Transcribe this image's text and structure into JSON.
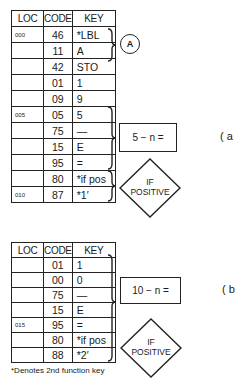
{
  "headers": [
    "LOC",
    "CODE",
    "KEY"
  ],
  "table_a": {
    "rows": [
      {
        "loc": "000",
        "code": "46",
        "key": "*LBL"
      },
      {
        "loc": "",
        "code": "11",
        "key": "A"
      },
      {
        "loc": "",
        "code": "42",
        "key": "STO"
      },
      {
        "loc": "",
        "code": "01",
        "key": "1"
      },
      {
        "loc": "",
        "code": "09",
        "key": "9"
      },
      {
        "loc": "005",
        "code": "05",
        "key": "5"
      },
      {
        "loc": "",
        "code": "75",
        "key": "—"
      },
      {
        "loc": "",
        "code": "15",
        "key": "E"
      },
      {
        "loc": "",
        "code": "95",
        "key": "="
      },
      {
        "loc": "",
        "code": "80",
        "key": "*if pos"
      },
      {
        "loc": "010",
        "code": "87",
        "key": "*1′"
      }
    ],
    "label_circle": "A",
    "box_label": "5 − n =",
    "diamond_line1": "IF",
    "diamond_line2": "POSITIVE",
    "part_label": "( a"
  },
  "table_b": {
    "rows": [
      {
        "loc": "",
        "code": "01",
        "key": "1"
      },
      {
        "loc": "",
        "code": "00",
        "key": "0"
      },
      {
        "loc": "",
        "code": "75",
        "key": "—"
      },
      {
        "loc": "",
        "code": "15",
        "key": "E"
      },
      {
        "loc": "015",
        "code": "95",
        "key": "="
      },
      {
        "loc": "",
        "code": "80",
        "key": "*if pos"
      },
      {
        "loc": "",
        "code": "88",
        "key": "*2′"
      }
    ],
    "box_label": "10 − n =",
    "diamond_line1": "IF",
    "diamond_line2": "POSITIVE",
    "part_label": "( b"
  },
  "footnote": "*Denotes 2nd function key"
}
